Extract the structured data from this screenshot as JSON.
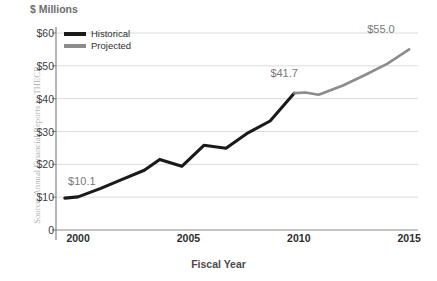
{
  "source_note": "Source: Annual Financial Reports to THECB",
  "chart_data": {
    "type": "line",
    "title": "",
    "ylabel": "$ Millions",
    "xlabel": "Fiscal Year",
    "ylim": [
      0,
      60
    ],
    "xlim": [
      1999,
      2015.4
    ],
    "grid": true,
    "legend_position": "top-left",
    "ytick_labels": [
      "$60",
      "$50",
      "$40",
      "$30",
      "$20",
      "$10",
      "0"
    ],
    "ytick_values": [
      60,
      50,
      40,
      30,
      20,
      10,
      0
    ],
    "xtick_labels": [
      "2000",
      "2005",
      "2010",
      "2015"
    ],
    "xtick_values": [
      2000,
      2005,
      2010,
      2015
    ],
    "series": [
      {
        "name": "Historical",
        "color": "#1a1a1a",
        "x": [
          1999.4,
          2000,
          2001,
          2002,
          2003,
          2003.7,
          2004.7,
          2005.7,
          2006.7,
          2007.7,
          2008.7,
          2009.8
        ],
        "values": [
          9.7,
          10.1,
          12.6,
          15.4,
          18.2,
          21.5,
          19.4,
          25.8,
          24.9,
          29.6,
          33.2,
          41.7
        ]
      },
      {
        "name": "Projected",
        "color": "#8c8c8c",
        "x": [
          2009.8,
          2010.3,
          2010.9,
          2012,
          2013,
          2014,
          2015
        ],
        "values": [
          41.7,
          41.9,
          41.2,
          44.0,
          47.2,
          50.6,
          55.0
        ]
      }
    ],
    "annotations": [
      {
        "label": "$10.1",
        "x": 2000.0,
        "y": 10.1
      },
      {
        "label": "$41.7",
        "x": 2009.8,
        "y": 41.7
      },
      {
        "label": "$55.0",
        "x": 2015.0,
        "y": 55.0
      }
    ],
    "legend": [
      {
        "label": "Historical",
        "color": "#1a1a1a"
      },
      {
        "label": "Projected",
        "color": "#8c8c8c"
      }
    ]
  }
}
